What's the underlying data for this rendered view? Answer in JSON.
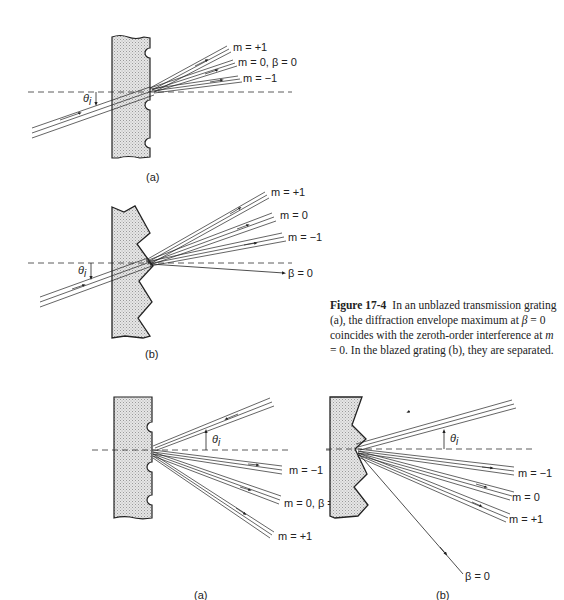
{
  "figure": {
    "number": "Figure 17-4",
    "caption_parts": {
      "p1": "In an unblazed transmission grating (a), the diffraction envelope maximum at ",
      "beta": "β",
      "p2": " = 0 coincides with the zeroth-order interference at ",
      "m": "m",
      "p3": " = 0. In the blazed grating (b), they are separated."
    }
  },
  "panels": {
    "transmission_a": {
      "label": "(a)",
      "grating": "unblazed",
      "incident_angle": "θi",
      "orders": [
        "m = +1",
        "m = 0, β = 0",
        "m = −1"
      ]
    },
    "transmission_b": {
      "label": "(b)",
      "grating": "blazed",
      "incident_angle": "θi",
      "orders": [
        "m = +1",
        "m = 0",
        "m = −1"
      ],
      "envelope": "β = 0"
    },
    "reflection_a": {
      "label": "(a)",
      "grating": "unblazed",
      "incident_angle": "θi",
      "orders": [
        "m = −1",
        "m = 0, β = 0",
        "m = +1"
      ]
    },
    "reflection_b": {
      "label": "(b)",
      "grating": "blazed",
      "incident_angle": "θi",
      "orders": [
        "m = −1",
        "m = 0",
        "m = +1"
      ],
      "envelope": "β = 0"
    }
  },
  "colors": {
    "ink": "#222222",
    "grating_fill": "#d9d9d9",
    "background": "#ffffff"
  }
}
